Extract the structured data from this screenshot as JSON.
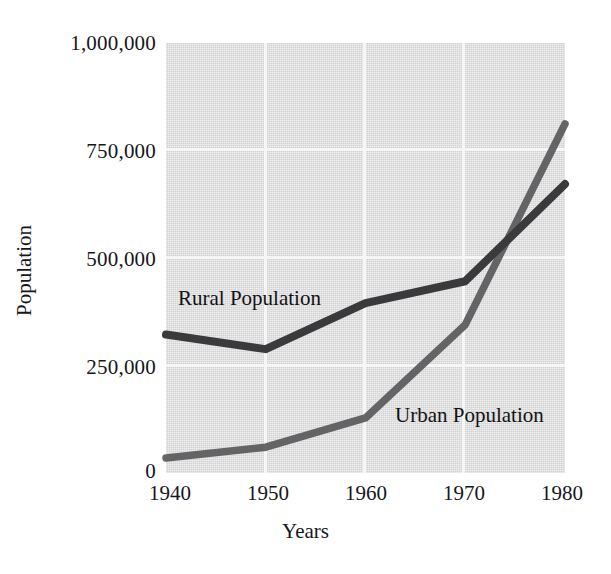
{
  "chart_data": {
    "type": "line",
    "title": "",
    "xlabel": "Years",
    "ylabel": "Population",
    "x": [
      1940,
      1950,
      1960,
      1970,
      1980
    ],
    "xticklabels": [
      "1940",
      "1950",
      "1960",
      "1970",
      "1980"
    ],
    "yticklabels": [
      "1,000,000",
      "750,000",
      "500,000",
      "250,000",
      "0"
    ],
    "ytickvalues": [
      1000000,
      750000,
      500000,
      250000,
      0
    ],
    "xlim": [
      1940,
      1980
    ],
    "ylim": [
      0,
      1000000
    ],
    "grid": true,
    "legend_position": "inline-annotations",
    "series": [
      {
        "name": "Rural Population",
        "label": "Rural Population",
        "color": "#3a3a3c",
        "values": [
          322000,
          288000,
          395000,
          446000,
          672000
        ]
      },
      {
        "name": "Urban Population",
        "label": "Urban Population",
        "color": "#5a5a5c",
        "values": [
          35000,
          60000,
          128000,
          345000,
          812000
        ]
      }
    ],
    "annotations": [
      {
        "text": "Rural Population",
        "series": "Rural Population"
      },
      {
        "text": "Urban Population",
        "series": "Urban Population"
      }
    ],
    "plot_background": "#dcdcdc",
    "gridline_color": "#f6f6f6"
  },
  "axes": {
    "y_title": "Population",
    "x_title": "Years",
    "y_ticks": [
      {
        "label": "1,000,000",
        "value": 1000000
      },
      {
        "label": "750,000",
        "value": 750000
      },
      {
        "label": "500,000",
        "value": 500000
      },
      {
        "label": "250,000",
        "value": 250000
      },
      {
        "label": "0",
        "value": 0
      }
    ],
    "x_ticks": [
      {
        "label": "1940",
        "value": 1940
      },
      {
        "label": "1950",
        "value": 1950
      },
      {
        "label": "1960",
        "value": 1960
      },
      {
        "label": "1970",
        "value": 1970
      },
      {
        "label": "1980",
        "value": 1980
      }
    ]
  }
}
